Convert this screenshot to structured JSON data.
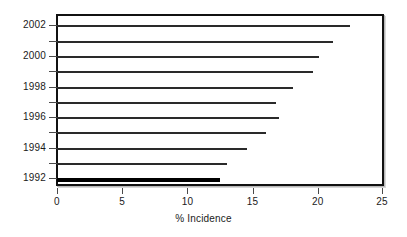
{
  "chart_data": {
    "type": "bar",
    "orientation": "horizontal",
    "title": "",
    "xlabel": "% Incidence",
    "ylabel": "",
    "xlim": [
      0,
      25
    ],
    "xticks": [
      0,
      5,
      10,
      15,
      20,
      25
    ],
    "xtick_labels": [
      "0",
      "5",
      "10",
      "15",
      "20",
      "25"
    ],
    "categories": [
      "1992",
      "1993",
      "1994",
      "1995",
      "1996",
      "1997",
      "1998",
      "1999",
      "2000",
      "2001",
      "2002"
    ],
    "ytick_labels": [
      "1992",
      "1994",
      "1996",
      "1998",
      "2000",
      "2002"
    ],
    "values": [
      12.5,
      13.0,
      14.6,
      16.0,
      17.0,
      16.8,
      18.1,
      19.6,
      20.1,
      21.2,
      22.5
    ],
    "grid": false,
    "legend": null,
    "bars": [
      {
        "category": "2002",
        "value": 22.5,
        "emphasis": false
      },
      {
        "category": "2001",
        "value": 21.2,
        "emphasis": false
      },
      {
        "category": "2000",
        "value": 20.1,
        "emphasis": false
      },
      {
        "category": "1999",
        "value": 19.6,
        "emphasis": false
      },
      {
        "category": "1998",
        "value": 18.1,
        "emphasis": false
      },
      {
        "category": "1997",
        "value": 16.8,
        "emphasis": false
      },
      {
        "category": "1996",
        "value": 17.0,
        "emphasis": false
      },
      {
        "category": "1995",
        "value": 16.0,
        "emphasis": false
      },
      {
        "category": "1994",
        "value": 14.6,
        "emphasis": false
      },
      {
        "category": "1993",
        "value": 13.0,
        "emphasis": false
      },
      {
        "category": "1992",
        "value": 12.5,
        "emphasis": true
      }
    ]
  },
  "axis": {
    "x_title": "% Incidence",
    "x_tick_labels": [
      "0",
      "5",
      "10",
      "15",
      "20",
      "25"
    ],
    "y_tick_labels": [
      "2002",
      "2000",
      "1998",
      "1996",
      "1994",
      "1992"
    ]
  },
  "style": {
    "bar_color": "#2a2a2a",
    "emphasis_bar_color": "#000000",
    "frame_color": "#111111",
    "background": "#ffffff",
    "text_color": "#1a1a1a"
  }
}
